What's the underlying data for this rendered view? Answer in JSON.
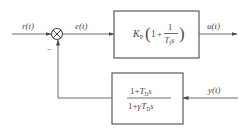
{
  "diagram": {
    "type": "block-diagram",
    "title": "",
    "signals": {
      "input": "r(t)",
      "error": "e(t)",
      "output": "u(t)",
      "feedback_input": "y(t)"
    },
    "summing_junction": {
      "minus_sign": "−"
    },
    "blocks": {
      "controller": {
        "gain": "K",
        "gain_sub": "P",
        "paren_open": "(",
        "one": "1",
        "plus": "+",
        "frac_num": "1",
        "frac_den_T": "T",
        "frac_den_sub": "I",
        "frac_den_s": "s",
        "paren_close": ")"
      },
      "feedback_filter": {
        "num_one": "1",
        "num_plus": "+",
        "num_T": "T",
        "num_sub": "D",
        "num_s": "s",
        "den_one": "1",
        "den_plus": "+",
        "den_gamma": "γ",
        "den_T": "T",
        "den_sub": "D",
        "den_s": "s"
      }
    },
    "colors": {
      "line": "#6a6a6a",
      "text": "#4a4a4a",
      "background": "#ffffff"
    }
  }
}
